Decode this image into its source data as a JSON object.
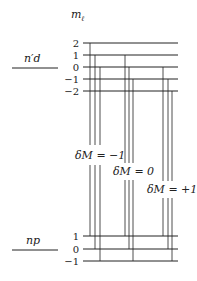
{
  "axis_label": {
    "main": "m",
    "sub": "ℓ"
  },
  "upper_state": {
    "label": "n′d",
    "levels": [
      {
        "m": "2",
        "y": 43
      },
      {
        "m": "1",
        "y": 55
      },
      {
        "m": "0",
        "y": 67
      },
      {
        "m": "−1",
        "y": 79
      },
      {
        "m": "−2",
        "y": 91
      }
    ]
  },
  "lower_state": {
    "label": "np",
    "levels": [
      {
        "m": "1",
        "y": 236
      },
      {
        "m": "0",
        "y": 249
      },
      {
        "m": "−1",
        "y": 261
      }
    ]
  },
  "transition_groups": [
    {
      "label": "δM = −1",
      "lines": [
        [
          90,
          0,
          0
        ],
        [
          95,
          1,
          1
        ],
        [
          100,
          2,
          2
        ]
      ],
      "gap": [
        145,
        165
      ],
      "label_x": 75,
      "label_y": 159
    },
    {
      "label": "δM = 0",
      "lines": [
        [
          125,
          1,
          0
        ],
        [
          129,
          2,
          1
        ],
        [
          133,
          3,
          2
        ]
      ],
      "gap": [
        163,
        180
      ],
      "label_x": 113,
      "label_y": 175
    },
    {
      "label": "δM = +1",
      "lines": [
        [
          163,
          2,
          0
        ],
        [
          168,
          3,
          1
        ],
        [
          172,
          4,
          2
        ]
      ],
      "gap": [
        181,
        198
      ],
      "label_x": 147,
      "label_y": 193
    }
  ],
  "colors": {
    "line": "#222222"
  }
}
